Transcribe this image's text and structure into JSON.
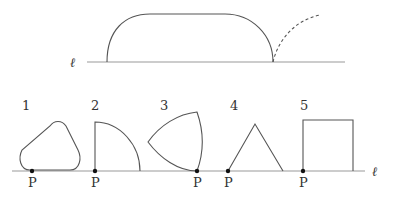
{
  "top_figure": {
    "line_label": "ℓ",
    "description": "A rounded shape rolled along line ℓ with dashed trajectory arc"
  },
  "bottom_figure": {
    "line_label": "ℓ",
    "shapes": [
      {
        "number": "1",
        "shape": "rounded-triangle",
        "point_label": "P"
      },
      {
        "number": "2",
        "shape": "quarter-circle",
        "point_label": "P"
      },
      {
        "number": "3",
        "shape": "reuleaux-triangle",
        "point_label": "P"
      },
      {
        "number": "4",
        "shape": "equilateral-triangle",
        "point_label": "P"
      },
      {
        "number": "5",
        "shape": "square",
        "point_label": "P"
      }
    ]
  },
  "colors": {
    "stroke": "#555555",
    "line": "#888888",
    "point": "#111111"
  }
}
